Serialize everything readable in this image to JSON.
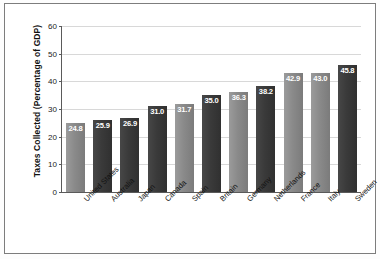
{
  "chart_data": {
    "type": "bar",
    "title": "",
    "xlabel": "",
    "ylabel": "Taxes Collected (Percentage of GDP)",
    "ylim": [
      0,
      60
    ],
    "yticks": [
      0,
      10,
      20,
      30,
      40,
      50,
      60
    ],
    "ytick_labels": [
      "0",
      "10",
      "20",
      "30",
      "40",
      "50",
      "60"
    ],
    "grid": true,
    "legend": "none",
    "categories": [
      "United States",
      "Australia",
      "Japan",
      "Canada",
      "Spain",
      "Britain",
      "Germany",
      "Netherlands",
      "France",
      "Italy",
      "Sweden"
    ],
    "values": [
      24.8,
      25.9,
      26.9,
      31.0,
      31.7,
      35.0,
      36.3,
      38.2,
      42.9,
      43.0,
      45.8
    ],
    "value_labels": [
      "24.8",
      "25.9",
      "26.9",
      "31.0",
      "31.7",
      "35.0",
      "36.3",
      "38.2",
      "42.9",
      "43.0",
      "45.8"
    ],
    "bar_shades": [
      "light",
      "dark",
      "dark",
      "dark",
      "light",
      "dark",
      "light",
      "dark",
      "light",
      "light",
      "dark"
    ],
    "colors": {
      "bar_light": "#8a8a8a",
      "bar_dark": "#3a3a3a",
      "value_label": "#ffffff",
      "gridline": "#d8d8d8",
      "axis": "#5a5a5a",
      "frame": "#7d7d7d",
      "background": "#ffffff",
      "text": "#111111"
    }
  }
}
